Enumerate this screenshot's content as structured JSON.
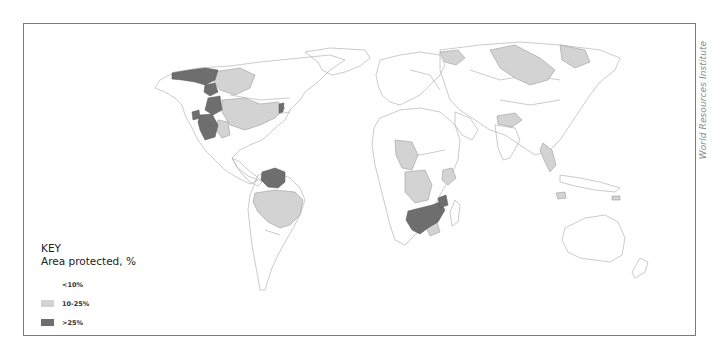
{
  "map": {
    "subject": "Protected area by river basin / region, world map",
    "credit": "World Resources Institute",
    "colors": {
      "background": "#ffffff",
      "border": "#7a7a7a",
      "outline": "#9a9a9a",
      "low": "#ffffff",
      "mid": "#d3d3d3",
      "high": "#6e6e6e"
    }
  },
  "legend": {
    "title": "KEY",
    "subtitle": "Area protected, %",
    "items": [
      {
        "label": "<10%",
        "color": "#ffffff"
      },
      {
        "label": "10-25%",
        "color": "#d3d3d3"
      },
      {
        "label": ">25%",
        "color": "#6e6e6e"
      }
    ]
  }
}
